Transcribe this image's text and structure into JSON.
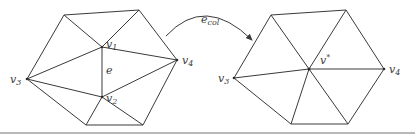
{
  "figure": {
    "operation_label": {
      "base": "e",
      "sub": "col"
    },
    "before": {
      "vertex_labels": {
        "v1": {
          "base": "v",
          "sub": "1"
        },
        "v2": {
          "base": "v",
          "sub": "2"
        },
        "v3": {
          "base": "v",
          "sub": "3"
        },
        "v4": {
          "base": "v",
          "sub": "4"
        }
      },
      "edge_label": "e"
    },
    "after": {
      "vertex_labels": {
        "vstar": {
          "base": "v",
          "sup": "*"
        },
        "v3": {
          "base": "v",
          "sub": "3"
        },
        "v4": {
          "base": "v",
          "sub": "4"
        }
      }
    }
  },
  "colors": {
    "stroke": "#3a3a3a",
    "rule": "#b8b8b8",
    "background": "#ffffff"
  }
}
